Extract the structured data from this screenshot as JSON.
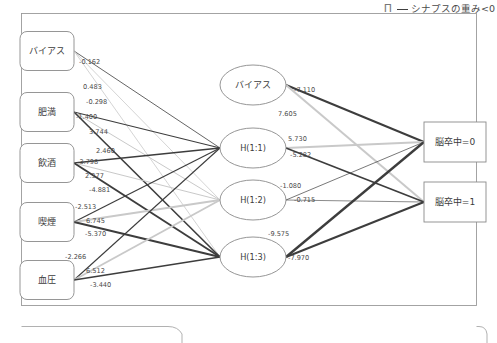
{
  "legend": {
    "glyph_icon": "pi-glyph",
    "glyph": "Π",
    "line_label": "シナプスの重み<0"
  },
  "colors": {
    "negative_edge": "#3d3d3d",
    "positive_edge": "#c9c9c9",
    "node_stroke": "#8a8a8a",
    "frame": "#9a9a9a",
    "text": "#3c3c3c"
  },
  "chart_data": {
    "type": "diagram",
    "title": "",
    "layers": [
      {
        "name": "input",
        "shape": "rounded-rect",
        "nodes": [
          {
            "id": "in_bias",
            "label": "バイアス",
            "x": 47,
            "y": 51
          },
          {
            "id": "in_obesity",
            "label": "肥満",
            "x": 47,
            "y": 112
          },
          {
            "id": "in_alcohol",
            "label": "飲酒",
            "x": 47,
            "y": 163
          },
          {
            "id": "in_smoking",
            "label": "喫煙",
            "x": 47,
            "y": 222
          },
          {
            "id": "in_bp",
            "label": "血圧",
            "x": 47,
            "y": 280
          }
        ]
      },
      {
        "name": "hidden",
        "shape": "ellipse",
        "nodes": [
          {
            "id": "h_bias",
            "label": "バイアス",
            "x": 253,
            "y": 85
          },
          {
            "id": "h11",
            "label": "H(1:1)",
            "x": 253,
            "y": 148
          },
          {
            "id": "h12",
            "label": "H(1:2)",
            "x": 253,
            "y": 200
          },
          {
            "id": "h13",
            "label": "H(1:3)",
            "x": 253,
            "y": 257
          }
        ]
      },
      {
        "name": "output",
        "shape": "rect",
        "nodes": [
          {
            "id": "out0",
            "label": "脳卒中=0",
            "x": 455,
            "y": 142
          },
          {
            "id": "out1",
            "label": "脳卒中=1",
            "x": 455,
            "y": 202
          }
        ]
      }
    ],
    "input_weight_labels": [
      {
        "value": "-0.162",
        "x": 79,
        "y": 62
      },
      {
        "value": "0.483",
        "x": 83,
        "y": 87
      },
      {
        "value": "-0.298",
        "x": 86,
        "y": 102
      },
      {
        "value": "-1.400",
        "x": 76,
        "y": 117
      },
      {
        "value": "3.744",
        "x": 89,
        "y": 132
      },
      {
        "value": "2.460",
        "x": 96,
        "y": 151
      },
      {
        "value": "-3.798",
        "x": 77,
        "y": 162
      },
      {
        "value": "2.377",
        "x": 85,
        "y": 176
      },
      {
        "value": "-4.881",
        "x": 89,
        "y": 190
      },
      {
        "value": "-2.513",
        "x": 75,
        "y": 207
      },
      {
        "value": "6.745",
        "x": 86,
        "y": 221
      },
      {
        "value": "-5.370",
        "x": 85,
        "y": 234
      },
      {
        "value": "-2.266",
        "x": 65,
        "y": 257
      },
      {
        "value": "6.512",
        "x": 86,
        "y": 271
      },
      {
        "value": "-3.440",
        "x": 90,
        "y": 285
      }
    ],
    "hidden_weight_labels": [
      {
        "value": "-7.110",
        "x": 294,
        "y": 90
      },
      {
        "value": "7.605",
        "x": 278,
        "y": 114
      },
      {
        "value": "5.730",
        "x": 288,
        "y": 139
      },
      {
        "value": "-5.282",
        "x": 290,
        "y": 155
      },
      {
        "value": "-1.080",
        "x": 280,
        "y": 186
      },
      {
        "value": "-0.715",
        "x": 294,
        "y": 200
      },
      {
        "value": "-9.575",
        "x": 268,
        "y": 234
      },
      {
        "value": "-7.970",
        "x": 288,
        "y": 258
      }
    ],
    "edges": [
      {
        "from": "in_bias",
        "to": "h11",
        "sign": "negative",
        "w": 0.8
      },
      {
        "from": "in_bias",
        "to": "h12",
        "sign": "positive",
        "w": 0.8
      },
      {
        "from": "in_bias",
        "to": "h13",
        "sign": "positive",
        "w": 0.8
      },
      {
        "from": "in_obesity",
        "to": "h11",
        "sign": "negative",
        "w": 1.1
      },
      {
        "from": "in_obesity",
        "to": "h12",
        "sign": "positive",
        "w": 1.0
      },
      {
        "from": "in_obesity",
        "to": "h13",
        "sign": "negative",
        "w": 1.6
      },
      {
        "from": "in_alcohol",
        "to": "h11",
        "sign": "negative",
        "w": 1.6
      },
      {
        "from": "in_alcohol",
        "to": "h12",
        "sign": "positive",
        "w": 1.0
      },
      {
        "from": "in_alcohol",
        "to": "h13",
        "sign": "negative",
        "w": 1.9
      },
      {
        "from": "in_smoking",
        "to": "h11",
        "sign": "negative",
        "w": 1.2
      },
      {
        "from": "in_smoking",
        "to": "h12",
        "sign": "positive",
        "w": 1.8
      },
      {
        "from": "in_smoking",
        "to": "h13",
        "sign": "negative",
        "w": 2.0
      },
      {
        "from": "in_bp",
        "to": "h11",
        "sign": "negative",
        "w": 1.1
      },
      {
        "from": "in_bp",
        "to": "h12",
        "sign": "positive",
        "w": 1.9
      },
      {
        "from": "in_bp",
        "to": "h13",
        "sign": "negative",
        "w": 1.5
      },
      {
        "from": "h_bias",
        "to": "out0",
        "sign": "negative",
        "w": 2.0
      },
      {
        "from": "h_bias",
        "to": "out1",
        "sign": "positive",
        "w": 2.0
      },
      {
        "from": "h11",
        "to": "out0",
        "sign": "positive",
        "w": 1.8
      },
      {
        "from": "h11",
        "to": "out1",
        "sign": "negative",
        "w": 1.7
      },
      {
        "from": "h12",
        "to": "out0",
        "sign": "negative",
        "w": 0.7
      },
      {
        "from": "h12",
        "to": "out1",
        "sign": "negative",
        "w": 0.6
      },
      {
        "from": "h13",
        "to": "out0",
        "sign": "negative",
        "w": 2.3
      },
      {
        "from": "h13",
        "to": "out1",
        "sign": "negative",
        "w": 2.0
      }
    ]
  }
}
